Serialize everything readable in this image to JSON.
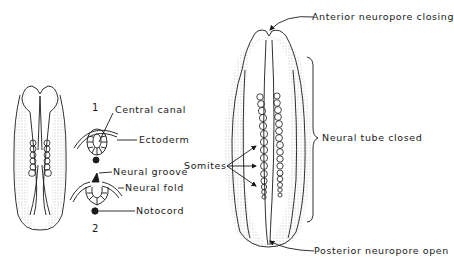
{
  "figure": {
    "colors": {
      "ink": "#1a1a1a",
      "background": "#ffffff",
      "stipple": "#777777"
    },
    "small_embryo": {
      "somite_pairs": 6
    },
    "cross_sections": [
      {
        "number": "1",
        "labels": [
          "Central canal",
          "Ectoderm"
        ]
      },
      {
        "number": "2",
        "labels": [
          "Neural groove",
          "Neural fold",
          "Notocord"
        ]
      }
    ],
    "labels": {
      "central_canal": "Central canal",
      "ectoderm": "Ectoderm",
      "neural_groove": "Neural groove",
      "neural_fold": "Neural fold",
      "notocord": "Notocord",
      "section_1": "1",
      "section_2": "2",
      "somites": "Somites",
      "anterior_neuropore": "Anterior neuropore closing",
      "neural_tube_closed": "Neural tube closed",
      "posterior_neuropore": "Posterior neuropore open"
    },
    "large_embryo": {
      "somite_pairs": 13
    }
  }
}
